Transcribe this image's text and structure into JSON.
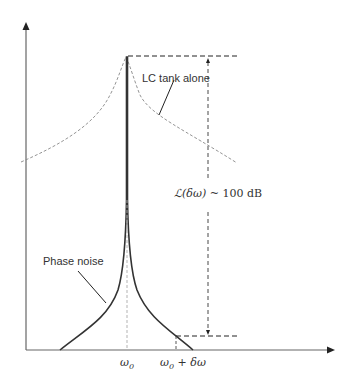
{
  "diagram": {
    "type": "phase-noise-spectrum",
    "labels": {
      "lc_tank": "LC tank alone",
      "phase_noise": "Phase noise",
      "omega0": "ω",
      "omega0_sub": "0",
      "offset_omega": "ω",
      "offset_sub": "0",
      "offset_rest": " + δω",
      "dynamic_range_lhs": "ℒ(δω)",
      "dynamic_range_rhs": " ~ 100 dB"
    },
    "colors": {
      "axis": "#555555",
      "phase_noise_curve": "#333333",
      "lc_tank_curve": "#888888",
      "dashed": "#222222",
      "text": "#333333"
    }
  }
}
